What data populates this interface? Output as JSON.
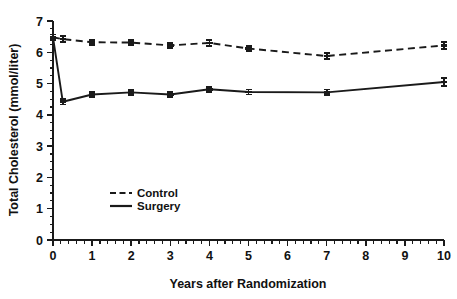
{
  "chart_data": {
    "type": "line",
    "title": "",
    "xlabel": "Years after Randomization",
    "ylabel": "Total Cholesterol (mmol/liter)",
    "xlim": [
      0,
      10
    ],
    "ylim": [
      0,
      7
    ],
    "grid": false,
    "legend_position": "center-left-inside",
    "x_ticks": [
      "0",
      "1",
      "2",
      "3",
      "4",
      "5",
      "6",
      "7",
      "8",
      "9",
      "10"
    ],
    "x_tick_values": [
      0,
      1,
      2,
      3,
      4,
      5,
      6,
      7,
      8,
      9,
      10
    ],
    "x_minor_interval": 0.2,
    "y_ticks": [
      "0",
      "1",
      "2",
      "3",
      "4",
      "5",
      "6",
      "7"
    ],
    "y_tick_values": [
      0,
      1,
      2,
      3,
      4,
      5,
      6,
      7
    ],
    "y_minor_interval": 0.25,
    "series": [
      {
        "name": "Control",
        "style": "dashed",
        "x": [
          0,
          0.25,
          1,
          2,
          3,
          4,
          5,
          7,
          10
        ],
        "values": [
          6.48,
          6.42,
          6.32,
          6.31,
          6.22,
          6.3,
          6.12,
          5.88,
          6.22
        ],
        "errors": [
          0.09,
          0.1,
          0.08,
          0.08,
          0.09,
          0.09,
          0.09,
          0.1,
          0.12
        ]
      },
      {
        "name": "Surgery",
        "style": "solid",
        "x": [
          0,
          0.25,
          1,
          2,
          3,
          4,
          5,
          7,
          10
        ],
        "values": [
          6.48,
          4.42,
          4.65,
          4.72,
          4.65,
          4.82,
          4.73,
          4.72,
          5.05
        ],
        "errors": [
          0.09,
          0.09,
          0.08,
          0.08,
          0.08,
          0.08,
          0.08,
          0.09,
          0.13
        ]
      }
    ],
    "legend": [
      {
        "label": "Control",
        "style": "dashed"
      },
      {
        "label": "Surgery",
        "style": "solid"
      }
    ]
  }
}
